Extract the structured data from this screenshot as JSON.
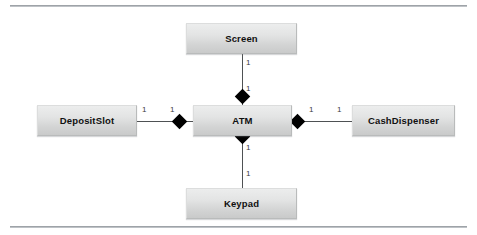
{
  "diagram": {
    "type": "uml-class-diagram",
    "frame": {
      "top_rule": "",
      "bottom_rule": ""
    },
    "classes": [
      {
        "id": "screen",
        "name": "Screen"
      },
      {
        "id": "depositslot",
        "name": "DepositSlot"
      },
      {
        "id": "atm",
        "name": "ATM"
      },
      {
        "id": "cashdispenser",
        "name": "CashDispenser"
      },
      {
        "id": "keypad",
        "name": "Keypad"
      }
    ],
    "associations": [
      {
        "from": "atm",
        "to": "screen",
        "kind": "composition",
        "from_multiplicity": "1",
        "to_multiplicity": "1"
      },
      {
        "from": "atm",
        "to": "depositslot",
        "kind": "composition",
        "from_multiplicity": "1",
        "to_multiplicity": "1"
      },
      {
        "from": "atm",
        "to": "cashdispenser",
        "kind": "composition",
        "from_multiplicity": "1",
        "to_multiplicity": "1"
      },
      {
        "from": "atm",
        "to": "keypad",
        "kind": "composition",
        "from_multiplicity": "1",
        "to_multiplicity": "1"
      }
    ],
    "multiplicities": {
      "screen_near_screen": "1",
      "screen_near_atm": "1",
      "depositslot_near_depositslot": "1",
      "depositslot_near_atm": "1",
      "cashdispenser_near_atm": "1",
      "cashdispenser_near_cashdispenser": "1",
      "keypad_near_atm": "1",
      "keypad_near_keypad": "1"
    },
    "colors": {
      "box_fill_top": "#eceded",
      "box_fill_bottom": "#c9caca",
      "box_border": "#b9bbbb",
      "text": "#101010",
      "link": "#4e5153",
      "diamond": "#000000",
      "rule": "#9ea3a8",
      "background": "#ffffff"
    }
  }
}
